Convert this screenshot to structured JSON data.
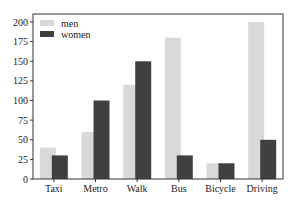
{
  "chart_data": {
    "type": "bar",
    "title": "",
    "xlabel": "",
    "ylabel": "",
    "categories": [
      "Taxi",
      "Metro",
      "Walk",
      "Bus",
      "Bicycle",
      "Driving"
    ],
    "series": [
      {
        "name": "men",
        "color": "#d9d9d9",
        "values": [
          40,
          60,
          120,
          180,
          20,
          200
        ]
      },
      {
        "name": "women",
        "color": "#404040",
        "values": [
          30,
          100,
          150,
          30,
          20,
          50
        ]
      }
    ],
    "ylim": [
      0,
      200
    ],
    "yticks": [
      0,
      25,
      50,
      75,
      100,
      125,
      150,
      175,
      200
    ],
    "grid": false,
    "legend_position": "upper left"
  },
  "legend": {
    "items": [
      {
        "label": "men"
      },
      {
        "label": "women"
      }
    ]
  }
}
